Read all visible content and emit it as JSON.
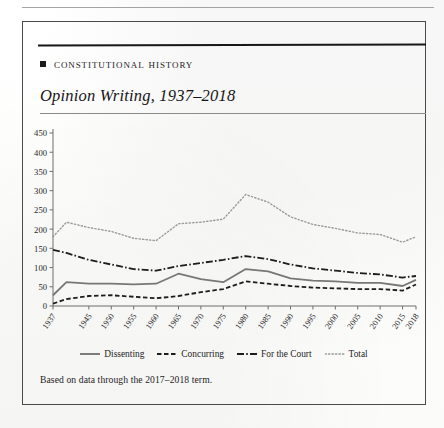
{
  "section": {
    "bullet_icon": "square-bullet-icon",
    "heading": "Constitutional History"
  },
  "figure": {
    "title": "Opinion Writing, 1937–2018",
    "source_note": "Based on data through the 2017–2018 term."
  },
  "legend": {
    "position": "bottom-center",
    "items": [
      {
        "label": "Dissenting",
        "style": "solid",
        "color": "#777777"
      },
      {
        "label": "Concurring",
        "style": "dashed",
        "color": "#1d1d1d"
      },
      {
        "label": "For the Court",
        "style": "dashdot",
        "color": "#1d1d1d"
      },
      {
        "label": "Total",
        "style": "dotted",
        "color": "#9a9a9a"
      }
    ]
  },
  "chart_data": {
    "type": "line",
    "title": "Opinion Writing, 1937–2018",
    "xlabel": "",
    "ylabel": "",
    "ylim": [
      0,
      450
    ],
    "ytick_step": 50,
    "yticks": [
      0,
      50,
      100,
      150,
      200,
      250,
      300,
      350,
      400,
      450
    ],
    "grid": false,
    "xlim": [
      1937,
      2018
    ],
    "xticks": [
      1937,
      1945,
      1950,
      1955,
      1960,
      1965,
      1970,
      1975,
      1980,
      1985,
      1990,
      1995,
      2000,
      2005,
      2010,
      2015,
      2018
    ],
    "x": [
      1937,
      1940,
      1945,
      1950,
      1955,
      1960,
      1965,
      1970,
      1975,
      1980,
      1985,
      1990,
      1995,
      2000,
      2005,
      2010,
      2015,
      2018
    ],
    "series": [
      {
        "name": "For the Court",
        "style": "dashdot",
        "color": "#1d1d1d",
        "values": [
          146,
          138,
          120,
          108,
          96,
          92,
          104,
          112,
          120,
          130,
          122,
          108,
          98,
          92,
          86,
          82,
          74,
          78
        ]
      },
      {
        "name": "Dissenting",
        "style": "solid",
        "color": "#777777",
        "values": [
          28,
          62,
          58,
          58,
          56,
          58,
          84,
          70,
          62,
          96,
          90,
          72,
          66,
          64,
          60,
          60,
          52,
          68
        ]
      },
      {
        "name": "Concurring",
        "style": "dashed",
        "color": "#1d1d1d",
        "values": [
          6,
          18,
          26,
          28,
          24,
          20,
          26,
          36,
          44,
          64,
          58,
          52,
          48,
          46,
          44,
          44,
          40,
          56
        ]
      },
      {
        "name": "Total",
        "style": "dotted",
        "color": "#9a9a9a",
        "values": [
          180,
          218,
          204,
          194,
          176,
          170,
          214,
          218,
          226,
          290,
          270,
          232,
          212,
          202,
          190,
          186,
          166,
          180
        ]
      }
    ]
  }
}
